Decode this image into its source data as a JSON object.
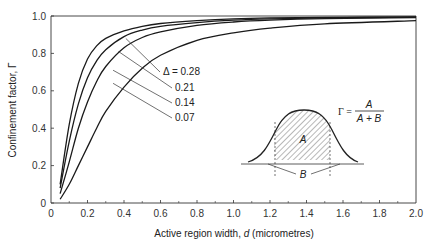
{
  "chart_data": {
    "type": "line",
    "title": "",
    "xlabel": "Active region width, d (micrometres)",
    "ylabel": "Confinement factor, Γ",
    "xlim": [
      0,
      2.0
    ],
    "ylim": [
      0,
      1.0
    ],
    "x_ticks": [
      "0",
      "0.2",
      "0.4",
      "0.6",
      "0.8",
      "1.0",
      "1.2",
      "1.4",
      "1.6",
      "1.8",
      "2.0"
    ],
    "y_ticks": [
      "0",
      "0.2",
      "0.4",
      "0.6",
      "0.8",
      "1.0"
    ],
    "grid": false,
    "x": [
      0.05,
      0.1,
      0.15,
      0.2,
      0.25,
      0.3,
      0.4,
      0.5,
      0.6,
      0.8,
      1.0,
      1.2,
      1.5,
      2.0
    ],
    "series": [
      {
        "name": "Δ = 0.28",
        "values": [
          0.1,
          0.42,
          0.64,
          0.77,
          0.84,
          0.88,
          0.92,
          0.945,
          0.96,
          0.975,
          0.985,
          0.99,
          0.993,
          0.995
        ]
      },
      {
        "name": "0.21",
        "values": [
          0.08,
          0.33,
          0.53,
          0.67,
          0.76,
          0.82,
          0.89,
          0.925,
          0.945,
          0.965,
          0.978,
          0.985,
          0.99,
          0.994
        ]
      },
      {
        "name": "0.14",
        "values": [
          0.05,
          0.22,
          0.4,
          0.54,
          0.65,
          0.73,
          0.83,
          0.885,
          0.915,
          0.95,
          0.968,
          0.978,
          0.986,
          0.992
        ]
      },
      {
        "name": "0.07",
        "values": [
          0.02,
          0.1,
          0.2,
          0.3,
          0.4,
          0.49,
          0.62,
          0.72,
          0.79,
          0.87,
          0.91,
          0.935,
          0.958,
          0.975
        ]
      }
    ],
    "annotations": [
      "Γ = A / (A + B)",
      "inset: Gaussian mode profile with hatched region A between dashed lines, tails B outside"
    ],
    "legend_position": "inline labels with leader lines"
  },
  "labels": {
    "curves": [
      "Δ = 0.28",
      "0.21",
      "0.14",
      "0.07"
    ],
    "ylabel": "Confinement factor, Γ",
    "xlabel_prefix": "Active region width, ",
    "xlabel_var": "d",
    "xlabel_suffix": " (micrometres)",
    "formula_lhs": "Γ =",
    "formula_num": "A",
    "formula_den": "A + B",
    "inset_a": "A",
    "inset_b": "B"
  }
}
